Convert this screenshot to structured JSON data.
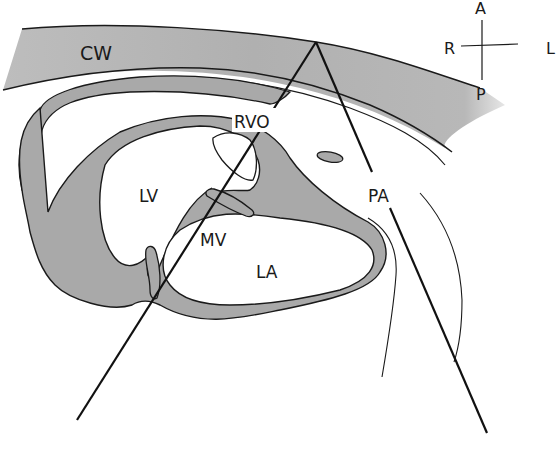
{
  "diagram": {
    "type": "anatomical-echocardiography-view",
    "labels": {
      "chest_wall": "CW",
      "right_ventricular_outflow": "RVO",
      "left_ventricle": "LV",
      "mitral_valve": "MV",
      "left_atrium": "LA",
      "pulmonary_artery": "PA"
    },
    "orientation": {
      "anterior": "A",
      "posterior": "P",
      "right": "R",
      "left": "L"
    },
    "colors": {
      "tissue_fill": "#a9a9a9",
      "chest_wall_fill": "#b4b4b4",
      "outline": "#1a1a1a",
      "background": "#ffffff"
    },
    "scan_sector": {
      "apex": [
        316,
        42
      ],
      "left_ray_end": [
        77,
        420
      ],
      "right_ray_end": [
        487,
        433
      ]
    }
  }
}
